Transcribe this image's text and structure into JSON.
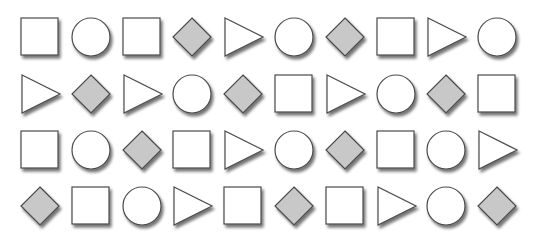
{
  "grid": {
    "rows": 4,
    "cols": 10,
    "row_centers": [
      37,
      94,
      150,
      206
    ],
    "col_start": 40,
    "col_step": 50.8
  },
  "colors": {
    "outline": "#4a4a4a",
    "white_fill": "#ffffff",
    "diamond_fill": "#c8c8c8",
    "shadow": "#8a8a8a"
  },
  "cells": [
    [
      "square",
      "circle",
      "square",
      "diamond",
      "triangle",
      "circle",
      "diamond",
      "square",
      "triangle",
      "circle"
    ],
    [
      "triangle",
      "diamond",
      "triangle",
      "circle",
      "diamond",
      "square",
      "triangle",
      "circle",
      "diamond",
      "square"
    ],
    [
      "square",
      "circle",
      "diamond",
      "square",
      "triangle",
      "circle",
      "diamond",
      "square",
      "circle",
      "triangle"
    ],
    [
      "diamond",
      "square",
      "circle",
      "triangle",
      "square",
      "diamond",
      "square",
      "triangle",
      "circle",
      "diamond"
    ]
  ]
}
